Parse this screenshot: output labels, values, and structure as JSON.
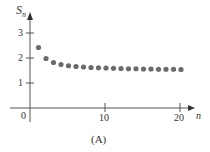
{
  "chart_data": {
    "type": "scatter",
    "title": "",
    "caption": "(A)",
    "xlabel": "n",
    "ylabel": "S_n",
    "ylabel_main": "S",
    "ylabel_sub": "n",
    "xlim": [
      0,
      21
    ],
    "ylim": [
      0,
      3.8
    ],
    "x_ticks": [
      10,
      20
    ],
    "x_tick_labels": [
      "10",
      "20"
    ],
    "y_ticks": [
      1,
      2,
      3
    ],
    "y_tick_labels": [
      "1",
      "2",
      "3"
    ],
    "origin_label": "0",
    "grid": false,
    "legend": null,
    "dot_color": "#6b6b6b",
    "axis_color": "#555555",
    "x": [
      1,
      2,
      3,
      4,
      5,
      6,
      7,
      8,
      9,
      10,
      11,
      12,
      13,
      14,
      15,
      16,
      17,
      18,
      19,
      20
    ],
    "values": [
      2.42,
      1.98,
      1.82,
      1.74,
      1.69,
      1.66,
      1.64,
      1.62,
      1.61,
      1.6,
      1.59,
      1.58,
      1.57,
      1.57,
      1.56,
      1.56,
      1.55,
      1.55,
      1.55,
      1.54
    ]
  }
}
